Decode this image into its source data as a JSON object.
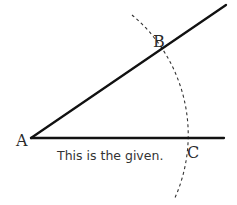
{
  "diagram": {
    "type": "geometric-construction",
    "points": {
      "A": {
        "label": "A"
      },
      "B": {
        "label": "B"
      },
      "C": {
        "label": "C"
      }
    },
    "caption": "This is the given.",
    "colors": {
      "line": "#111111",
      "arc": "#333333",
      "text": "#2a2a2a",
      "background": "#ffffff"
    }
  }
}
